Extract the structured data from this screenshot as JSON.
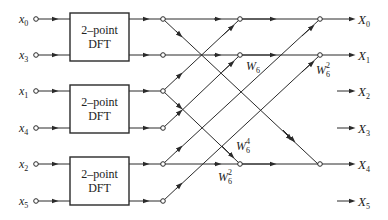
{
  "diagram": {
    "inputs": [
      {
        "base": "x",
        "sub": "0",
        "y": 19
      },
      {
        "base": "x",
        "sub": "3",
        "y": 55
      },
      {
        "base": "x",
        "sub": "1",
        "y": 91
      },
      {
        "base": "x",
        "sub": "4",
        "y": 128
      },
      {
        "base": "x",
        "sub": "2",
        "y": 164
      },
      {
        "base": "x",
        "sub": "5",
        "y": 201
      }
    ],
    "dft_blocks": [
      {
        "line1": "2–point",
        "line2": "DFT"
      },
      {
        "line1": "2–point",
        "line2": "DFT"
      },
      {
        "line1": "2–point",
        "line2": "DFT"
      }
    ],
    "outputs": [
      {
        "base": "X",
        "sub": "0",
        "y": 19
      },
      {
        "base": "X",
        "sub": "1",
        "y": 55
      },
      {
        "base": "X",
        "sub": "2",
        "y": 91
      },
      {
        "base": "X",
        "sub": "3",
        "y": 128
      },
      {
        "base": "X",
        "sub": "4",
        "y": 164
      },
      {
        "base": "X",
        "sub": "5",
        "y": 201
      }
    ],
    "twiddles": [
      {
        "base": "W",
        "sub": "6",
        "sup": "",
        "x": 246,
        "y": 70
      },
      {
        "base": "W",
        "sub": "6",
        "sup": "2",
        "x": 316,
        "y": 74
      },
      {
        "base": "W",
        "sub": "6",
        "sup": "4",
        "x": 236,
        "y": 150
      },
      {
        "base": "W",
        "sub": "6",
        "sup": "2",
        "x": 218,
        "y": 181
      }
    ]
  }
}
